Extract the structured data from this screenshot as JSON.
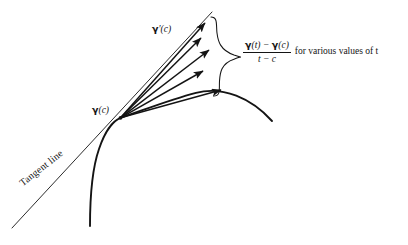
{
  "figure": {
    "background_color": "#ffffff",
    "ink_color": "#141414",
    "curve_label": "curve gamma",
    "labels": {
      "tangent_line": "Tangent line",
      "gamma_prime_c": "γ′(c)",
      "gamma_prime_c_vector": "γ",
      "gamma_prime_c_suffix": "′(c)",
      "gamma_c_vector": "γ",
      "gamma_c_suffix": "(c)"
    },
    "annotation": {
      "numerator_gamma_1": "γ",
      "numerator_arg_1": "(t)",
      "numerator_minus": "−",
      "numerator_gamma_2": "γ",
      "numerator_arg_2": "(c)",
      "denominator": "t − c",
      "trailing_text": "for various values of t"
    },
    "elements": {
      "base_point_label": "base point gamma(c)",
      "arrow_count": 5,
      "brace": "right-pointing curly brace"
    }
  },
  "geometry": {
    "base_point": {
      "x": 120,
      "y": 118
    },
    "tangent_line": {
      "x1": 12,
      "y1": 228,
      "x2": 212,
      "y2": 12
    },
    "curve_path": "M 90 226 C 90 200 92 168 100 146 C 108 124 116 120 120 118 C 140 112 170 100 196 93 C 222 87 250 98 272 121",
    "arrows": [
      {
        "x": 206,
        "y": 22
      },
      {
        "x": 202,
        "y": 37
      },
      {
        "x": 211,
        "y": 49
      },
      {
        "x": 205,
        "y": 70
      },
      {
        "x": 224,
        "y": 89
      }
    ],
    "brace": {
      "top_x": 212,
      "top_y": 20,
      "bottom_x": 237,
      "bottom_y": 94,
      "tip_x": 241,
      "tip_y": 57
    }
  }
}
